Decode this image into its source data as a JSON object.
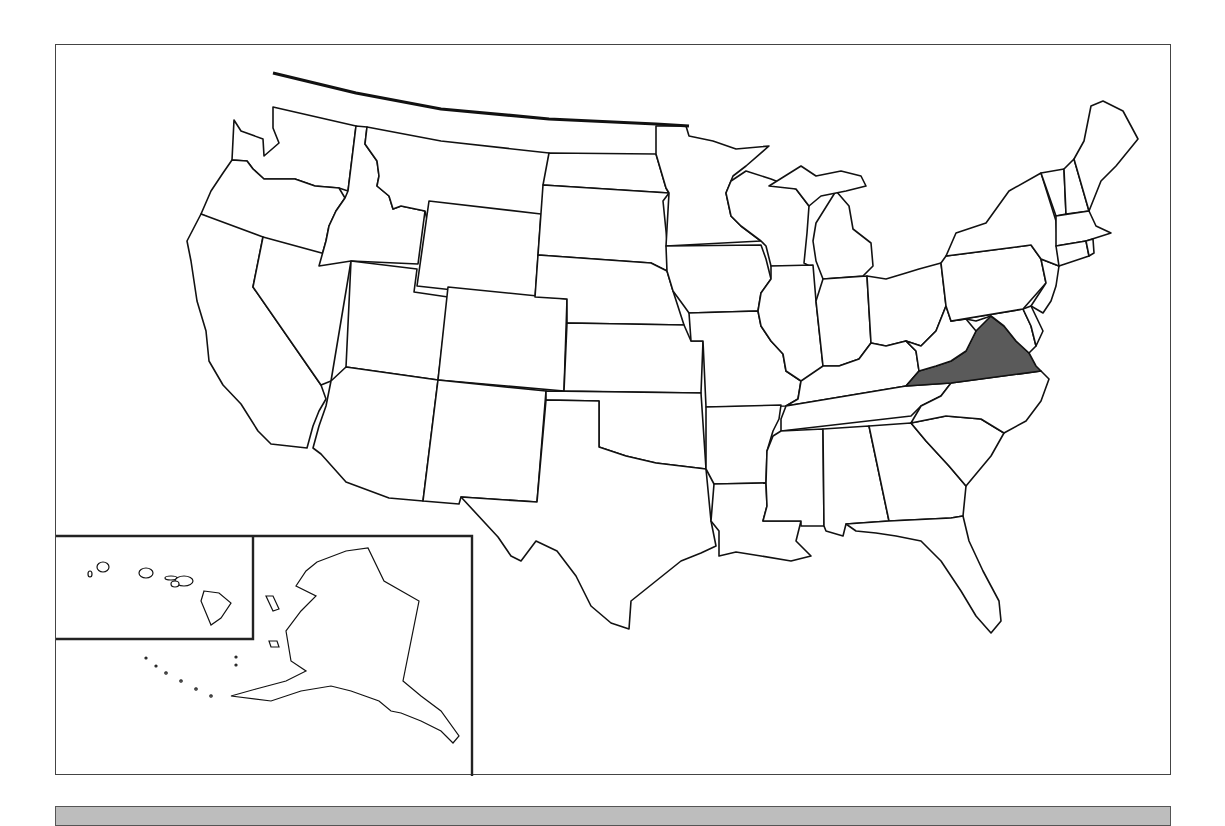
{
  "map": {
    "type": "us-states-outline",
    "highlighted_state": "Virginia",
    "highlight_color": "#5a5a5a",
    "state_fill": "#ffffff",
    "border_color": "#111111",
    "insets": [
      "Hawaii",
      "Alaska"
    ]
  },
  "bottom_bar": {
    "color": "#bdbdbd",
    "label": ""
  }
}
